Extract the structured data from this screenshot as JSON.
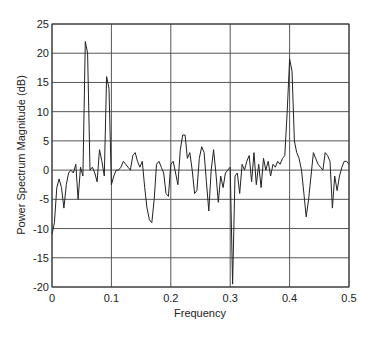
{
  "chart_data": {
    "type": "line",
    "title": "",
    "xlabel": "Frequency",
    "ylabel": "Power Spectrum Magnitude (dB)",
    "xlim": [
      0,
      0.5
    ],
    "ylim": [
      -20,
      25
    ],
    "grid": true,
    "legend": null,
    "x_ticks": [
      "0",
      "0.1",
      "0.2",
      "0.3",
      "0.4",
      "0.5"
    ],
    "y_ticks": [
      "25",
      "20",
      "15",
      "10",
      "5",
      "0",
      "-5",
      "-10",
      "-15",
      "-20"
    ],
    "series": [
      {
        "name": "spectrum",
        "color": "#222222",
        "x": [
          0.0,
          0.004,
          0.008,
          0.012,
          0.016,
          0.02,
          0.024,
          0.028,
          0.032,
          0.036,
          0.04,
          0.044,
          0.048,
          0.052,
          0.056,
          0.06,
          0.064,
          0.068,
          0.072,
          0.076,
          0.08,
          0.084,
          0.088,
          0.092,
          0.096,
          0.1,
          0.104,
          0.108,
          0.112,
          0.116,
          0.12,
          0.124,
          0.128,
          0.132,
          0.136,
          0.14,
          0.144,
          0.148,
          0.152,
          0.156,
          0.16,
          0.164,
          0.168,
          0.172,
          0.176,
          0.18,
          0.184,
          0.188,
          0.192,
          0.196,
          0.2,
          0.204,
          0.208,
          0.212,
          0.216,
          0.22,
          0.224,
          0.228,
          0.232,
          0.236,
          0.24,
          0.244,
          0.248,
          0.252,
          0.256,
          0.26,
          0.264,
          0.268,
          0.272,
          0.276,
          0.28,
          0.284,
          0.288,
          0.292,
          0.296,
          0.3,
          0.304,
          0.308,
          0.312,
          0.316,
          0.32,
          0.324,
          0.328,
          0.332,
          0.336,
          0.34,
          0.344,
          0.348,
          0.352,
          0.356,
          0.36,
          0.364,
          0.368,
          0.372,
          0.376,
          0.38,
          0.384,
          0.388,
          0.392,
          0.396,
          0.4,
          0.404,
          0.408,
          0.412,
          0.416,
          0.42,
          0.424,
          0.428,
          0.432,
          0.436,
          0.44,
          0.444,
          0.448,
          0.452,
          0.456,
          0.46,
          0.464,
          0.468,
          0.472,
          0.476,
          0.48,
          0.484,
          0.488,
          0.492,
          0.496,
          0.5
        ],
        "values": [
          -11,
          -9,
          -3,
          -1.5,
          -3,
          -6.5,
          -2.5,
          -0.5,
          0,
          -0.5,
          1,
          -5,
          0.5,
          -1,
          22,
          20,
          0,
          0.5,
          -0.5,
          -2,
          3.5,
          1.5,
          -1,
          16,
          14,
          -2.5,
          -1,
          0,
          0,
          0.5,
          1.5,
          1,
          0.5,
          0,
          2.5,
          3,
          1.5,
          0.5,
          1.5,
          -3,
          -6.5,
          -8.5,
          -9,
          -5,
          1,
          1.5,
          0.5,
          -0.5,
          -4,
          -4.5,
          1,
          1.5,
          -0.5,
          -2.5,
          3.5,
          6,
          6,
          2,
          3,
          0,
          -4,
          -3.5,
          2,
          4,
          3,
          -2,
          -7,
          0,
          3.5,
          -0.5,
          -5.5,
          -1,
          -3,
          -0.5,
          0,
          0.5,
          -19.5,
          -1,
          -0.5,
          -4,
          1,
          0,
          1.5,
          2.5,
          -2,
          3,
          -2.5,
          1,
          -3,
          2,
          0,
          1.5,
          -1,
          1,
          0.5,
          1.5,
          1,
          2,
          2.5,
          10,
          19,
          17,
          5,
          3,
          2,
          0,
          -4,
          -8,
          -5,
          -1,
          3,
          2,
          1,
          0.5,
          0,
          3,
          2.5,
          1.5,
          -6.5,
          -1,
          -3.5,
          -1,
          0.5,
          1.5,
          1.5,
          1
        ]
      }
    ]
  },
  "axes": {
    "x_label": "Frequency",
    "y_label": "Power Spectrum Magnitude (dB)"
  }
}
